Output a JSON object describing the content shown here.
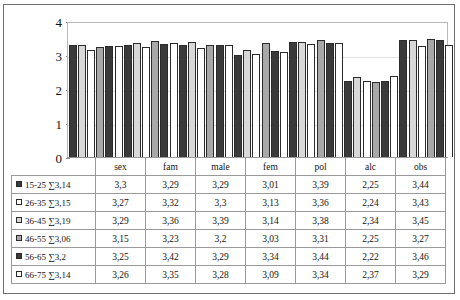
{
  "chart_data": {
    "type": "bar",
    "title": "",
    "xlabel": "",
    "ylabel": "",
    "ylim": [
      0,
      4
    ],
    "yticks": [
      "0",
      "1",
      "2",
      "3",
      "4"
    ],
    "grid": true,
    "legend_position": "table-left",
    "categories": [
      "sex",
      "fam",
      "male",
      "fem",
      "pol",
      "alc",
      "obs"
    ],
    "series": [
      {
        "name": "15-25",
        "sum_label": "∑3,14",
        "fill": "dark",
        "values": [
          "3,3",
          "3,29",
          "3,29",
          "3,01",
          "3,39",
          "2,25",
          "3,44"
        ]
      },
      {
        "name": "26-35",
        "sum_label": "∑3,15",
        "fill": "white",
        "values": [
          "3,27",
          "3,32",
          "3,3",
          "3,13",
          "3,36",
          "2,24",
          "3,43"
        ]
      },
      {
        "name": "36-45",
        "sum_label": "∑3,19",
        "fill": "light",
        "values": [
          "3,29",
          "3,36",
          "3,39",
          "3,14",
          "3,38",
          "2,34",
          "3,45"
        ]
      },
      {
        "name": "46-55",
        "sum_label": "∑3,06",
        "fill": "mid",
        "values": [
          "3,15",
          "3,23",
          "3,2",
          "3,03",
          "3,31",
          "2,25",
          "3,27"
        ]
      },
      {
        "name": "56-65",
        "sum_label": "∑3,2",
        "fill": "dark",
        "values": [
          "3,25",
          "3,42",
          "3,29",
          "3,34",
          "3,44",
          "2,22",
          "3,46"
        ]
      },
      {
        "name": "66-75",
        "sum_label": "∑3,14",
        "fill": "white",
        "values": [
          "3,26",
          "3,35",
          "3,28",
          "3,09",
          "3,34",
          "2,37",
          "3,29"
        ]
      }
    ],
    "bar_order_fills": [
      "dark",
      "light",
      "white",
      "mid",
      "dark",
      "white"
    ],
    "plot_values": {
      "sex": [
        3.3,
        3.29,
        3.15,
        3.25,
        3.27,
        3.26
      ],
      "fam": [
        3.29,
        3.36,
        3.23,
        3.42,
        3.32,
        3.35
      ],
      "male": [
        3.29,
        3.39,
        3.2,
        3.29,
        3.3,
        3.28
      ],
      "fem": [
        3.01,
        3.14,
        3.03,
        3.34,
        3.13,
        3.09
      ],
      "pol": [
        3.39,
        3.38,
        3.31,
        3.44,
        3.36,
        3.34
      ],
      "alc": [
        2.25,
        2.34,
        2.25,
        2.22,
        2.24,
        2.37
      ],
      "obs": [
        3.44,
        3.45,
        3.27,
        3.46,
        3.43,
        3.29
      ]
    }
  },
  "table": {
    "corner_label": "",
    "headers": [
      "sex",
      "fam",
      "male",
      "fem",
      "pol",
      "alc",
      "obs"
    ],
    "rows": [
      {
        "label": "15-25 ∑3,14",
        "cells": [
          "3,3",
          "3,29",
          "3,29",
          "3,01",
          "3,39",
          "2,25",
          "3,44"
        ]
      },
      {
        "label": "26-35 ∑3,15",
        "cells": [
          "3,27",
          "3,32",
          "3,3",
          "3,13",
          "3,36",
          "2,24",
          "3,43"
        ]
      },
      {
        "label": "36-45 ∑3,19",
        "cells": [
          "3,29",
          "3,36",
          "3,39",
          "3,14",
          "3,38",
          "2,34",
          "3,45"
        ]
      },
      {
        "label": "46-55 ∑3,06",
        "cells": [
          "3,15",
          "3,23",
          "3,2",
          "3,03",
          "3,31",
          "2,25",
          "3,27"
        ]
      },
      {
        "label": "56-65 ∑3,2",
        "cells": [
          "3,25",
          "3,42",
          "3,29",
          "3,34",
          "3,44",
          "2,22",
          "3,46"
        ]
      },
      {
        "label": "66-75 ∑3,14",
        "cells": [
          "3,26",
          "3,35",
          "3,28",
          "3,09",
          "3,34",
          "2,37",
          "3,29"
        ]
      }
    ]
  },
  "colors": {
    "dark": "#3a3a3a",
    "light": "#d8d8d8",
    "white": "#ffffff",
    "mid": "#a8a8a8",
    "border": "#2b2b2b",
    "grid": "#e2e2e2",
    "frame": "#6f6f6f"
  }
}
